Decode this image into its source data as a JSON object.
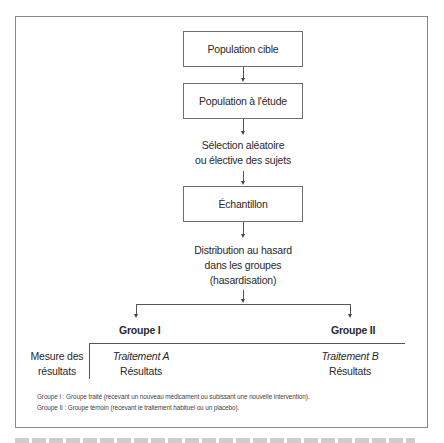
{
  "diagram": {
    "type": "flowchart",
    "nodes": {
      "target_population": "Population cible",
      "study_population": "Population à l'étude",
      "selection_line1": "Sélection aléatoire",
      "selection_line2": "ou élective des sujets",
      "sample": "Échantillon",
      "distribution_line1": "Distribution au hasard",
      "distribution_line2": "dans les groupes",
      "distribution_line3": "(hasardisation)"
    },
    "groups": {
      "group1": {
        "title": "Groupe I",
        "treatment": "Traitement A",
        "results": "Résultats"
      },
      "group2": {
        "title": "Groupe II",
        "treatment": "Traitement B",
        "results": "Résultats"
      }
    },
    "measure_label_line1": "Mesure des",
    "measure_label_line2": "résultats",
    "legend": {
      "line1": "Groupe I :  Groupe traité (recevant un nouveau médicament ou subissant une nouvelle intervention).",
      "line2": "Groupe II :  Groupe témoin (recevant le traitement habituel ou un placebo)."
    }
  }
}
